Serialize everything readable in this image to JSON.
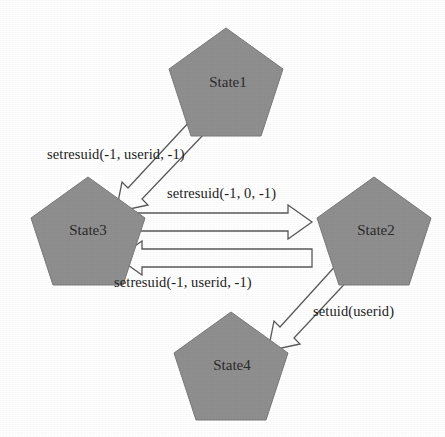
{
  "diagram": {
    "background_color": "#ffffff",
    "node_fill_color": "#8f8f8f",
    "node_stroke_color": "#7a7a7a",
    "arrow_fill_color": "#ffffff",
    "arrow_stroke_color": "#5a5a5a",
    "text_color": "#1c1c1c",
    "nodes": [
      {
        "id": "state1",
        "label": "State1",
        "shape": "pentagon",
        "cx": 226,
        "cy": 85
      },
      {
        "id": "state3",
        "label": "State3",
        "shape": "pentagon",
        "cx": 88,
        "cy": 234
      },
      {
        "id": "state2",
        "label": "State2",
        "shape": "pentagon",
        "cx": 374,
        "cy": 234
      },
      {
        "id": "state4",
        "label": "State4",
        "shape": "pentagon",
        "cx": 231,
        "cy": 366
      }
    ],
    "edges": [
      {
        "id": "edge-state1-state3",
        "from": "State1",
        "to": "State3",
        "label": "setresuid(-1, userid, -1)",
        "direction": "diagonal-down-left"
      },
      {
        "id": "edge-state3-state2",
        "from": "State3",
        "to": "State2",
        "label": "setresuid(-1, 0, -1)",
        "direction": "right"
      },
      {
        "id": "edge-state2-state3",
        "from": "State2",
        "to": "State3",
        "label": "setresuid(-1, userid, -1)",
        "direction": "left"
      },
      {
        "id": "edge-state2-state4",
        "from": "State2",
        "to": "State4",
        "label": "setuid(userid)",
        "direction": "diagonal-down-left"
      }
    ]
  }
}
